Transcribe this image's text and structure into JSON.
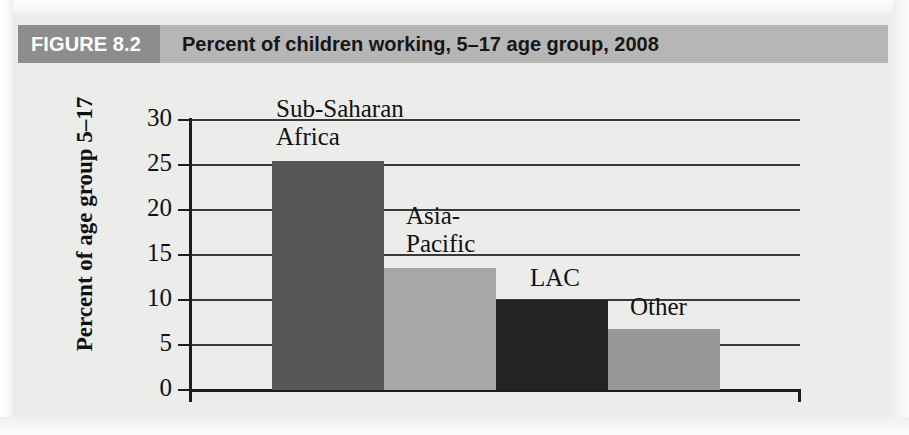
{
  "header": {
    "figure_number": "FIGURE 8.2",
    "title": "Percent of children working, 5–17 age group, 2008",
    "band_color": "#b6b6b6",
    "number_box_color": "#8d8d8d",
    "number_text_color": "#ffffff",
    "title_text_color": "#161616"
  },
  "page": {
    "background_color": "#ececeb"
  },
  "chart_data": {
    "type": "bar",
    "title": "Percent of children working, 5–17 age group, 2008",
    "xlabel": "",
    "ylabel": "Percent of age group 5–17",
    "ylim": [
      0,
      30
    ],
    "yticks": [
      0,
      5,
      10,
      15,
      20,
      25,
      30
    ],
    "ytick_labels": [
      "0",
      "5",
      "10",
      "15",
      "20",
      "25",
      "30"
    ],
    "grid": true,
    "grid_axis": "y",
    "legend": false,
    "categories": [
      "Sub-Saharan Africa",
      "Asia-Pacific",
      "LAC",
      "Other"
    ],
    "values": [
      25.4,
      13.6,
      10.0,
      6.8
    ],
    "bar_labels": [
      "Sub-Saharan\nAfrica",
      "Asia-\nPacific",
      "LAC",
      "Other"
    ],
    "bar_colors": [
      "#565656",
      "#a7a7a7",
      "#232323",
      "#979797"
    ],
    "axis_color": "#1d1d1d",
    "gridline_color": "#3a3a3a"
  }
}
